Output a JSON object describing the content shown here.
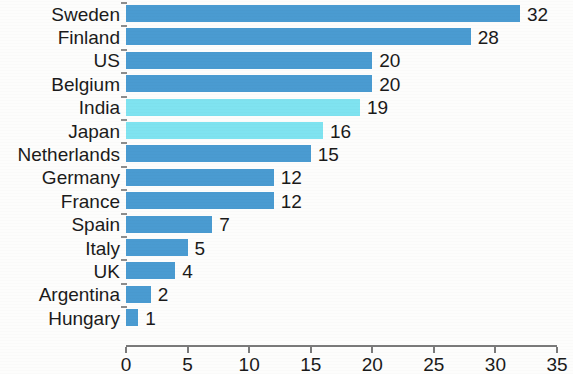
{
  "chart_data": {
    "type": "bar",
    "orientation": "horizontal",
    "title": "",
    "subtitle": "",
    "xlabel": "",
    "ylabel": "",
    "categories": [
      "Sweden",
      "Finland",
      "US",
      "Belgium",
      "India",
      "Japan",
      "Netherlands",
      "Germany",
      "France",
      "Spain",
      "Italy",
      "UK",
      "Argentina",
      "Hungary"
    ],
    "values": [
      32,
      28,
      20,
      20,
      19,
      16,
      15,
      12,
      12,
      7,
      5,
      4,
      2,
      1
    ],
    "value_labels": [
      "32",
      "28",
      "20",
      "20",
      "19",
      "16",
      "15",
      "12",
      "12",
      "7",
      "5",
      "4",
      "2",
      "1"
    ],
    "highlighted": [
      "India",
      "Japan"
    ],
    "xlim": [
      0,
      35
    ],
    "xticks": [
      0,
      5,
      10,
      15,
      20,
      25,
      30,
      35
    ],
    "xtick_labels": [
      "0",
      "5",
      "10",
      "15",
      "20",
      "25",
      "30",
      "35"
    ],
    "grid": false,
    "legend": false,
    "colors": {
      "bar": "#4a9bd1",
      "bar_highlight": "#7fe3f0",
      "axis": "#7a7a7a",
      "text": "#1a1a1a",
      "background": "#fdfdfc"
    }
  }
}
